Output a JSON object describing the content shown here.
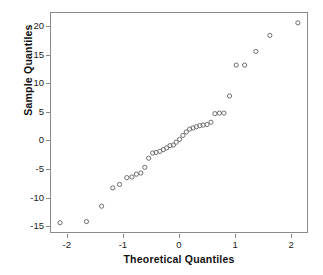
{
  "chart_data": {
    "type": "scatter",
    "title": "",
    "subtitle": "",
    "xlabel": "Theoretical Quantiles",
    "ylabel": "Sample Quantiles",
    "xlim": [
      -2.3,
      2.3
    ],
    "ylim": [
      -16.2,
      22.5
    ],
    "xticks": [
      -2,
      -1,
      0,
      1,
      2
    ],
    "yticks": [
      20,
      15,
      10,
      5,
      0,
      -5,
      -10,
      -15
    ],
    "xticklabels": [
      "-2",
      "-1",
      "0",
      "1",
      "2"
    ],
    "yticklabels": [
      "20",
      "15",
      "10",
      "5",
      "0",
      "-5",
      "-10",
      "-15"
    ],
    "grid": false,
    "legend": null,
    "marker": "open-circle",
    "marker_color": "#6e6e6e",
    "series": [
      {
        "name": "Q-Q points",
        "x": [
          -2.12,
          -1.65,
          -1.38,
          -1.18,
          -1.06,
          -0.93,
          -0.84,
          -0.76,
          -0.68,
          -0.61,
          -0.54,
          -0.47,
          -0.41,
          -0.34,
          -0.28,
          -0.22,
          -0.16,
          -0.1,
          -0.05,
          0.01,
          0.07,
          0.13,
          0.19,
          0.25,
          0.31,
          0.37,
          0.43,
          0.5,
          0.57,
          0.64,
          0.72,
          0.8,
          0.9,
          1.02,
          1.17,
          1.37,
          1.62,
          2.12
        ],
        "y": [
          -14.4,
          -14.2,
          -11.5,
          -8.3,
          -7.7,
          -6.5,
          -6.4,
          -5.9,
          -5.7,
          -4.7,
          -3.1,
          -2.2,
          -2.1,
          -1.9,
          -1.6,
          -1.3,
          -0.9,
          -0.8,
          -0.3,
          0.2,
          0.9,
          1.5,
          2.0,
          2.2,
          2.4,
          2.6,
          2.7,
          2.8,
          3.2,
          4.7,
          4.8,
          4.8,
          7.8,
          13.2,
          13.2,
          15.6,
          18.4,
          20.6
        ]
      }
    ]
  },
  "axes": {
    "x_title": "Theoretical Quantiles",
    "y_title": "Sample Quantiles"
  }
}
